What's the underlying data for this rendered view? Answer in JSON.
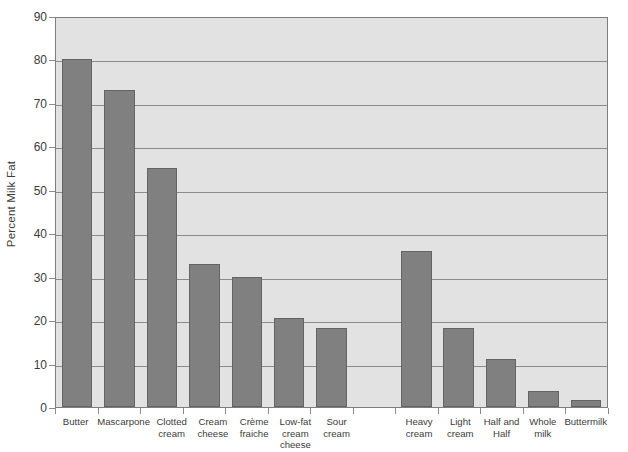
{
  "chart_data": {
    "type": "bar",
    "title": "",
    "subtitle": "",
    "xlabel": "",
    "ylabel": "Percent Milk Fat",
    "ylim": [
      0,
      90
    ],
    "ytick_step": 10,
    "yticks": [
      90,
      80,
      70,
      60,
      50,
      40,
      30,
      20,
      10,
      0
    ],
    "ytick_labels": [
      "90",
      "80",
      "70",
      "60",
      "50",
      "40",
      "30",
      "20",
      "10",
      "0"
    ],
    "grid": "horizontal",
    "legend": "none",
    "categories": [
      "Butter",
      "Mascarpone",
      "Clotted cream",
      "Cream cheese",
      "Crème fraiche",
      "Low-fat cream cheese",
      "Sour cream",
      "",
      "Heavy cream",
      "Light cream",
      "Half and Half",
      "Whole milk",
      "Buttermilk"
    ],
    "category_label_lines": [
      [
        "Butter"
      ],
      [
        "Mascarpone"
      ],
      [
        "Clotted",
        "cream"
      ],
      [
        "Cream",
        "cheese"
      ],
      [
        "Crème",
        "fraiche"
      ],
      [
        "Low-fat",
        "cream",
        "cheese"
      ],
      [
        "Sour",
        "cream"
      ],
      [
        ""
      ],
      [
        "Heavy",
        "cream"
      ],
      [
        "Light",
        "cream"
      ],
      [
        "Half and",
        "Half"
      ],
      [
        "Whole",
        "milk"
      ],
      [
        "Buttermilk"
      ]
    ],
    "values": [
      80,
      73,
      55,
      33,
      30,
      20.5,
      18.2,
      null,
      36,
      18.3,
      11,
      3.7,
      1.5
    ],
    "value_labels": [
      "80",
      "73",
      "55",
      "33",
      "30",
      "20.5",
      "18.2",
      "",
      "36",
      "18.3",
      "11",
      "3.7",
      "1.5"
    ],
    "series": [
      {
        "name": "Percent Milk Fat",
        "values": [
          80,
          73,
          55,
          33,
          30,
          20.5,
          18.2,
          null,
          36,
          18.3,
          11,
          3.7,
          1.5
        ]
      }
    ]
  },
  "colors": {
    "bar_fill": "#808080",
    "bar_stroke": "#646464",
    "plot_background": "#e2e2e2",
    "plot_border": "#7d7d7d",
    "gridline": "#8b8b8b",
    "text": "#3c3c3c",
    "page_background": "#ffffff"
  }
}
